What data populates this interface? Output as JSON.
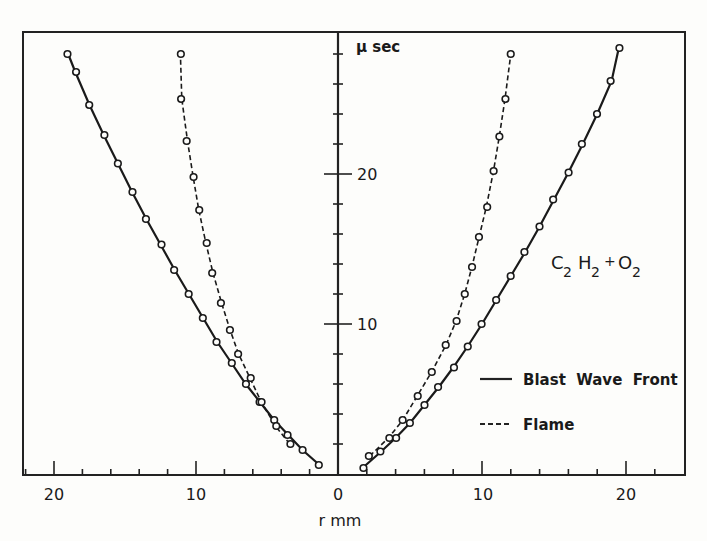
{
  "chart_data": {
    "type": "line",
    "title": "",
    "xlabel": "r mm",
    "ylabel": "μ sec",
    "xlim_left": [
      0,
      22
    ],
    "xlim_right": [
      0,
      24
    ],
    "ylim": [
      0,
      30
    ],
    "x_tick_labels": [
      "20",
      "10",
      "0",
      "10",
      "20"
    ],
    "y_tick_labels": [
      "10",
      "20"
    ],
    "grid": false,
    "annotation": "C2H2 + O2",
    "legend": [
      {
        "label": "Blast Wave Front",
        "style": "solid"
      },
      {
        "label": "Flame",
        "style": "dashed"
      }
    ],
    "series": [
      {
        "name": "Blast Wave Front (right)",
        "style": "solid",
        "r": [
          1.7,
          3.0,
          4.0,
          5.0,
          6.0,
          7.0,
          8.0,
          9.0,
          10.0,
          11.0,
          12.0,
          13.0,
          14.0,
          15.0,
          16.0,
          17.0,
          18.0,
          19.0,
          19.5
        ],
        "t": [
          0.4,
          1.5,
          2.4,
          3.4,
          4.6,
          5.8,
          7.1,
          8.5,
          10.0,
          11.6,
          13.2,
          14.8,
          16.5,
          18.3,
          20.1,
          22.0,
          24.0,
          26.2,
          28.4
        ]
      },
      {
        "name": "Flame (right)",
        "style": "dashed",
        "r": [
          2.2,
          3.5,
          4.5,
          5.5,
          6.5,
          7.5,
          8.2,
          8.8,
          9.3,
          9.8,
          10.3,
          10.8,
          11.2,
          11.6,
          12.0
        ],
        "t": [
          1.2,
          2.4,
          3.6,
          5.2,
          6.8,
          8.6,
          10.2,
          12.0,
          13.8,
          15.8,
          17.8,
          20.2,
          22.5,
          25.0,
          28.0
        ]
      },
      {
        "name": "Blast Wave Front (left)",
        "style": "solid",
        "r": [
          1.3,
          2.5,
          3.5,
          4.5,
          5.5,
          6.5,
          7.5,
          8.5,
          9.5,
          10.5,
          11.5,
          12.5,
          13.5,
          14.5,
          15.5,
          16.5,
          17.5,
          18.5,
          19.0
        ],
        "t": [
          0.6,
          1.6,
          2.6,
          3.6,
          4.8,
          6.0,
          7.4,
          8.8,
          10.4,
          12.0,
          13.6,
          15.3,
          17.0,
          18.8,
          20.7,
          22.6,
          24.6,
          26.8,
          28.0
        ]
      },
      {
        "name": "Flame (left)",
        "style": "dashed",
        "r": [
          3.4,
          4.4,
          5.4,
          6.2,
          7.0,
          7.6,
          8.2,
          8.8,
          9.3,
          9.8,
          10.2,
          10.6,
          11.0,
          11.1
        ],
        "t": [
          2.0,
          3.2,
          4.8,
          6.4,
          8.0,
          9.6,
          11.4,
          13.4,
          15.4,
          17.6,
          19.8,
          22.2,
          25.0,
          28.0
        ]
      }
    ]
  },
  "labels": {
    "y_unit": "μ sec",
    "x_unit": "r mm",
    "annotation_main": "C",
    "annotation_sub1": "2",
    "annotation_h": "H",
    "annotation_sub2": "2",
    "annotation_plus": "+",
    "annotation_o": "O",
    "annotation_sub3": "2",
    "legend_solid": "Blast  Wave  Front",
    "legend_dashed": "Flame",
    "xtick_l20": "20",
    "xtick_l10": "10",
    "xtick_0": "0",
    "xtick_r10": "10",
    "xtick_r20": "20",
    "ytick_10": "10",
    "ytick_20": "20"
  }
}
